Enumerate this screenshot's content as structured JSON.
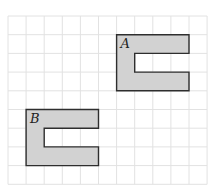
{
  "grid": {
    "origin_x": 8,
    "origin_y": 16,
    "cols": 11,
    "rows": 9,
    "cell_w": 18.1,
    "cell_h": 18.7,
    "line_color": "#e2e2e2"
  },
  "shapes": [
    {
      "id": "A",
      "label": "A",
      "col": 6,
      "row": 1,
      "w": 4,
      "h": 3,
      "notch": {
        "col": 7,
        "row": 2,
        "w": 3,
        "h": 1
      },
      "fill": "#d2d2d2",
      "stroke": "#2e2e2e"
    },
    {
      "id": "B",
      "label": "B",
      "col": 1,
      "row": 5,
      "w": 4,
      "h": 3,
      "notch": {
        "col": 2,
        "row": 6,
        "w": 3,
        "h": 1
      },
      "fill": "#d2d2d2",
      "stroke": "#2e2e2e"
    }
  ]
}
